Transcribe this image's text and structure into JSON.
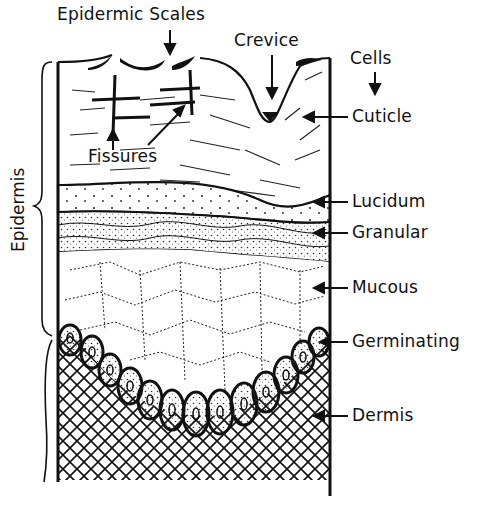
{
  "diagram": {
    "labels": {
      "epidermic_scales": "Epidermic Scales",
      "crevice": "Crevice",
      "cells": "Cells",
      "cuticle": "Cuticle",
      "fissures": "Fissures",
      "lucidum": "Lucidum",
      "granular": "Granular",
      "mucous": "Mucous",
      "germinating": "Germinating",
      "dermis": "Dermis",
      "epidermis": "Epidermis"
    },
    "colors": {
      "ink": "#111111",
      "paper": "#ffffff",
      "stipple": "#bdbdbd"
    }
  }
}
